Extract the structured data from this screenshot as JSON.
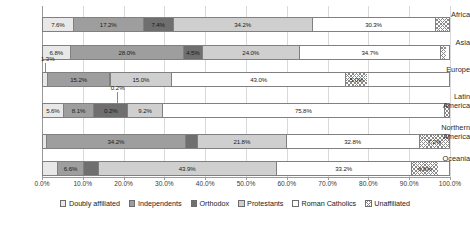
{
  "chart_data": {
    "type": "bar",
    "orientation": "horizontal",
    "stacked": true,
    "normalized_percent": true,
    "title": "",
    "xlabel": "",
    "ylabel": "",
    "xlim": [
      0,
      100
    ],
    "grid": true,
    "legend_position": "bottom",
    "xtick_labels": [
      "0.0%",
      "10.0%",
      "20.0%",
      "30.0%",
      "40.0%",
      "50.0%",
      "60.0%",
      "70.0%",
      "80.0%",
      "90.0%",
      "100.0%"
    ],
    "xticks": [
      0,
      10,
      20,
      30,
      40,
      50,
      60,
      70,
      80,
      90,
      100
    ],
    "categories": [
      "Africa",
      "Asia",
      "Europe",
      "Latin America",
      "Northern America",
      "Oceania"
    ],
    "series": [
      {
        "name": "Doubly affiliated",
        "color": "#e8e8e8",
        "values": [
          7.6,
          6.8,
          1.3,
          5.6,
          1.0,
          3.6
        ]
      },
      {
        "name": "Independents",
        "color": "#9e9e9e",
        "values": [
          17.2,
          28.0,
          15.2,
          8.1,
          34.2,
          6.6
        ]
      },
      {
        "name": "Orthodox",
        "color": "#6f6f6f",
        "values": [
          7.4,
          4.5,
          0.2,
          9.2,
          3.0,
          3.5
        ]
      },
      {
        "name": "Protestants",
        "color": "#cfcfcf",
        "values": [
          34.2,
          24.0,
          15.0,
          9.2,
          21.8,
          43.9
        ]
      },
      {
        "name": "Roman Catholics",
        "color": "#ffffff",
        "values": [
          30.3,
          34.7,
          43.0,
          75.8,
          32.8,
          33.2
        ]
      },
      {
        "name": "Unaffiliated",
        "color": "hatched",
        "values": [
          3.3,
          1.2,
          5.0,
          1.1,
          7.2,
          6.6
        ]
      }
    ],
    "bar_labels": [
      {
        "category": "Africa",
        "labels": [
          "7.6%",
          "17.2%",
          "7.4%",
          "34.2%",
          "30.3%",
          "3.3%"
        ]
      },
      {
        "category": "Asia",
        "labels": [
          "6.8%",
          "28.0%",
          "4.5%",
          "24.0%",
          "34.7%",
          "1.2%"
        ]
      },
      {
        "category": "Europe",
        "labels": [
          "1.3%",
          "15.2%",
          "",
          "15.0%",
          "43.0%",
          "5.0%"
        ]
      },
      {
        "category": "Latin America",
        "labels": [
          "5.6%",
          "8.1%",
          "0.2%",
          "9.2%",
          "75.8%",
          "1.1%"
        ]
      },
      {
        "category": "Northern America",
        "labels": [
          "",
          "34.2%",
          "3.0%",
          "21.8%",
          "32.8%",
          "7.2%"
        ]
      },
      {
        "category": "Oceania",
        "labels": [
          "3.6%",
          "6.6%",
          "3.5%",
          "43.9%",
          "33.2%",
          "6.6%"
        ]
      }
    ],
    "callouts": [
      {
        "category": "Europe",
        "series": "Doubly affiliated",
        "label": "1.3%"
      },
      {
        "category": "Latin America",
        "series": "Orthodox",
        "label": "0.2%"
      },
      {
        "category": "Latin America",
        "series": "Unaffiliated",
        "label": "1.1%"
      }
    ]
  },
  "legend": {
    "items": [
      {
        "label": "Doubly affiliated"
      },
      {
        "label": "Independents"
      },
      {
        "label": "Orthodox"
      },
      {
        "label": "Protestants"
      },
      {
        "label": "Roman Catholics"
      },
      {
        "label": "Unaffiliated"
      }
    ]
  }
}
